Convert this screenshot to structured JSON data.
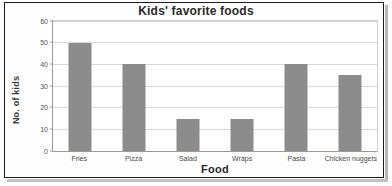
{
  "chart_data": {
    "type": "bar",
    "title": "Kids' favorite foods",
    "xlabel": "Food",
    "ylabel": "No. of kids",
    "categories": [
      "Fries",
      "Pizza",
      "Salad",
      "Wraps",
      "Pasta",
      "Chicken nuggets"
    ],
    "values": [
      50,
      40,
      15,
      15,
      40,
      35
    ],
    "ylim": [
      0,
      60
    ],
    "yticks": [
      0,
      10,
      20,
      30,
      40,
      50,
      60
    ],
    "ytick_labels": [
      "0",
      "10",
      "20",
      "30",
      "40",
      "50",
      "60"
    ],
    "grid": true,
    "legend": false,
    "bar_color": "#8c8c8c",
    "series": [
      {
        "name": "No. of kids",
        "values": [
          50,
          40,
          15,
          15,
          40,
          35
        ]
      }
    ]
  },
  "colors": {
    "bar": "#8c8c8c",
    "grid": "#d8d8d8",
    "axis": "#9a9a9a",
    "text": "#2a2a2a",
    "frame": "#1d1d1d"
  }
}
